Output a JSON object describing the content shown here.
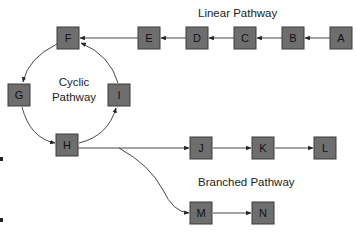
{
  "diagram": {
    "colors": {
      "node_fill": "#6e6e6e",
      "node_stroke": "#3a3a3a",
      "edge": "#333333",
      "text": "#222222"
    },
    "labels": {
      "linear": "Linear Pathway",
      "cyclic_line1": "Cyclic",
      "cyclic_line2": "Pathway",
      "branched": "Branched Pathway"
    },
    "nodes": {
      "A": "A",
      "B": "B",
      "C": "C",
      "D": "D",
      "E": "E",
      "F": "F",
      "G": "G",
      "H": "H",
      "I": "I",
      "J": "J",
      "K": "K",
      "L": "L",
      "M": "M",
      "N": "N"
    },
    "edges": [
      {
        "from": "A",
        "to": "B"
      },
      {
        "from": "B",
        "to": "C"
      },
      {
        "from": "C",
        "to": "D"
      },
      {
        "from": "D",
        "to": "E"
      },
      {
        "from": "E",
        "to": "F"
      },
      {
        "from": "F",
        "to": "G"
      },
      {
        "from": "G",
        "to": "H"
      },
      {
        "from": "H",
        "to": "I"
      },
      {
        "from": "I",
        "to": "F"
      },
      {
        "from": "H",
        "to": "J"
      },
      {
        "from": "J",
        "to": "K"
      },
      {
        "from": "K",
        "to": "L"
      },
      {
        "from": "H",
        "to": "M"
      },
      {
        "from": "M",
        "to": "N"
      }
    ]
  }
}
